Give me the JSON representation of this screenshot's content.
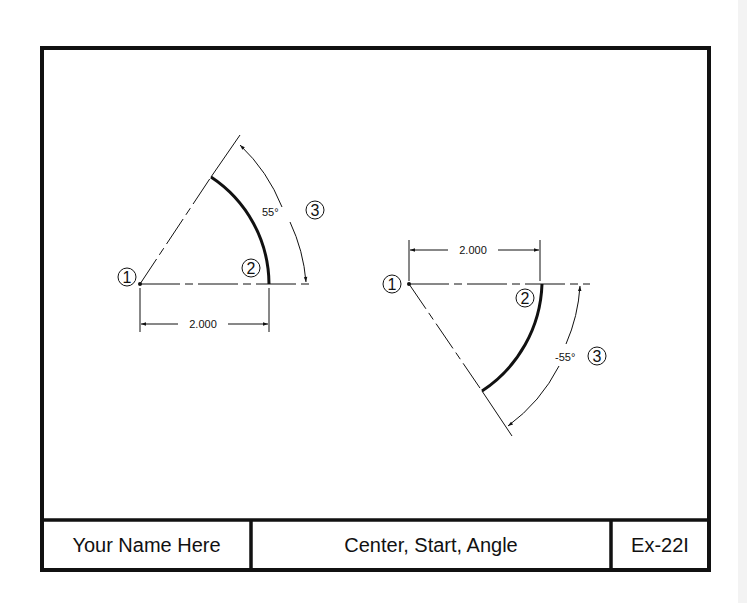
{
  "title_block": {
    "name": "Your Name Here",
    "title": "Center, Start, Angle",
    "exercise_id": "Ex-22I"
  },
  "figures": [
    {
      "id": "left",
      "center_marker": "1",
      "start_marker": "2",
      "angle_marker": "3",
      "radius_label": "2.000",
      "angle_label": "55°",
      "angle_deg": 55
    },
    {
      "id": "right",
      "center_marker": "1",
      "start_marker": "2",
      "angle_marker": "3",
      "radius_label": "2.000",
      "angle_label": "-55°",
      "angle_deg": -55
    }
  ],
  "colors": {
    "line": "#111111",
    "background": "#ffffff"
  }
}
